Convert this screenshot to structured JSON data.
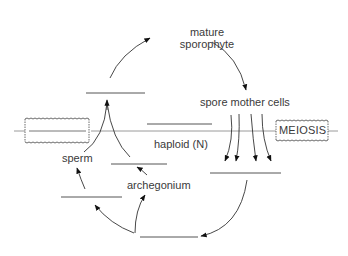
{
  "diagram": {
    "type": "life-cycle",
    "labels": {
      "mature_sporophyte_line1": "mature",
      "mature_sporophyte_line2": "sporophyte",
      "spore_mother_cells": "spore mother cells",
      "haploid": "haploid (N)",
      "meiosis": "MEIOSIS",
      "sperm": "sperm",
      "archegonium": "archegonium"
    },
    "blanks": [
      {
        "id": "blank-top-left",
        "x1": 86,
        "x2": 145,
        "y": 93
      },
      {
        "id": "blank-mid-center",
        "x1": 147,
        "x2": 212,
        "y": 124
      },
      {
        "id": "blank-archegonium-top",
        "x1": 111,
        "x2": 167,
        "y": 164
      },
      {
        "id": "blank-left-bottom",
        "x1": 61,
        "x2": 122,
        "y": 197
      },
      {
        "id": "blank-right-mid",
        "x1": 210,
        "x2": 281,
        "y": 173
      },
      {
        "id": "blank-bottom",
        "x1": 140,
        "x2": 198,
        "y": 237
      }
    ],
    "colors": {
      "line": "#555555",
      "text": "#3a3a3a",
      "divider": "#888888"
    }
  }
}
